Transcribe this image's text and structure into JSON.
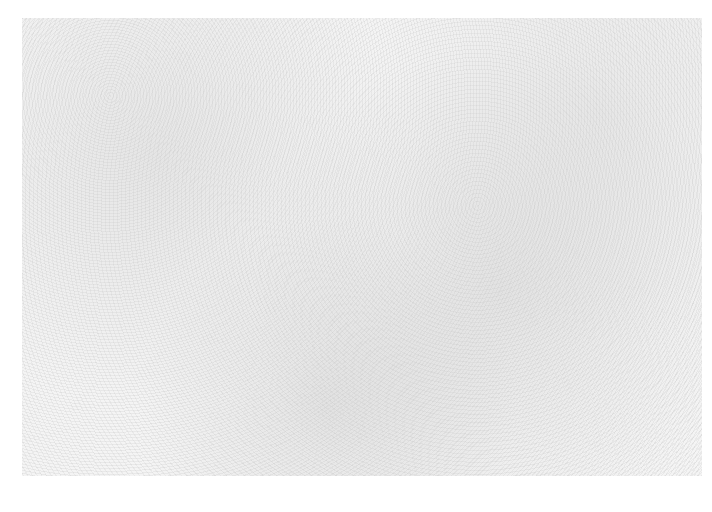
{
  "image": {
    "description": "faint gray speckled paper texture",
    "background_color": "#ffffff",
    "texture_color": "#f0f0f0"
  },
  "footer_mark": {
    "text": "",
    "legible": false
  }
}
